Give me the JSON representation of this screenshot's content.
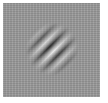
{
  "stimulus": {
    "type": "gabor-patch",
    "orientation_deg": 45,
    "background_color": "#9a9a9a",
    "light_color": "#f2f2f2",
    "dark_color": "#1c1c1c",
    "border_color": "#ffffff"
  }
}
